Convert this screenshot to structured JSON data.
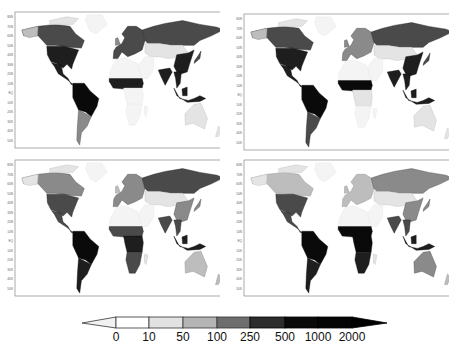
{
  "chart_data": {
    "type": "heatmap",
    "panels": [
      {
        "position": "top-left",
        "xlim": [
          "180",
          "180"
        ],
        "ylim": [
          "50S",
          "80N"
        ]
      },
      {
        "position": "top-right",
        "xlim": [
          "180",
          "180"
        ],
        "ylim": [
          "50S",
          "80N"
        ]
      },
      {
        "position": "bottom-left",
        "xlim": [
          "180",
          "180"
        ],
        "ylim": [
          "50S",
          "80N"
        ]
      },
      {
        "position": "bottom-right",
        "xlim": [
          "180",
          "180"
        ],
        "ylim": [
          "50S",
          "80N"
        ]
      }
    ],
    "x_tick_labels": [
      "180",
      "120W",
      "60W",
      "0",
      "60E",
      "120E",
      "180"
    ],
    "y_tick_labels": [
      "80N",
      "70N",
      "60N",
      "50N",
      "40N",
      "30N",
      "20N",
      "10N",
      "EQ",
      "10S",
      "20S",
      "30S",
      "40S",
      "50S"
    ],
    "colorbar": {
      "levels": [
        "0",
        "10",
        "50",
        "100",
        "250",
        "500",
        "1000",
        "2000"
      ],
      "colors": [
        "#f4f4f4",
        "#ffffff",
        "#e2e2e2",
        "#b4b4b4",
        "#6e6e6e",
        "#2c2c2c",
        "#0a0a0a",
        "#050505",
        "#000000"
      ],
      "extend": "both",
      "orientation": "horizontal"
    },
    "grid": false,
    "legend_position": "bottom"
  },
  "axes": {
    "x_ticks": [
      "180",
      "120W",
      "60W",
      "0",
      "60E",
      "120E",
      "180"
    ],
    "y_ticks": [
      "80N",
      "70N",
      "60N",
      "50N",
      "40N",
      "30N",
      "20N",
      "10N",
      "EQ",
      "10S",
      "20S",
      "30S",
      "40S",
      "50S"
    ]
  },
  "colorbar": {
    "labels": [
      "0",
      "10",
      "50",
      "100",
      "250",
      "500",
      "1000",
      "2000"
    ]
  }
}
